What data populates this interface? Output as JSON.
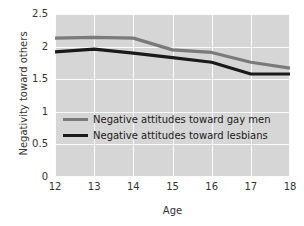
{
  "chart_data": {
    "type": "line",
    "title": "",
    "xlabel": "Age",
    "ylabel": "Negativity toward others",
    "x": [
      12,
      13,
      14,
      15,
      16,
      17,
      18
    ],
    "xtick_labels": [
      "12",
      "13",
      "14",
      "15",
      "16",
      "17",
      "18"
    ],
    "ytick_labels": [
      "0",
      "0.5",
      "1",
      "1.5",
      "2",
      "2.5"
    ],
    "ytick_values": [
      0,
      0.5,
      1,
      1.5,
      2,
      2.5
    ],
    "xlim": [
      12,
      18
    ],
    "ylim": [
      0,
      2.5
    ],
    "grid": true,
    "legend_position": "center-left",
    "plot_background": "#d6d6d6",
    "gridline_color": "#fbfbfb",
    "series": [
      {
        "name": "Negative attitudes toward gay men",
        "color": "#7a7a7a",
        "values": [
          2.13,
          2.14,
          2.13,
          1.95,
          1.91,
          1.76,
          1.67
        ]
      },
      {
        "name": "Negative attitudes toward lesbians",
        "color": "#1a1a1a",
        "values": [
          1.92,
          1.96,
          1.9,
          1.83,
          1.76,
          1.58,
          1.58
        ]
      }
    ]
  }
}
